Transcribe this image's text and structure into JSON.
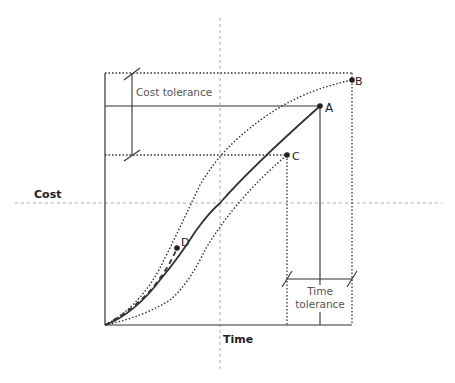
{
  "diagram": {
    "type": "project cost/time tolerance diagram",
    "axis_labels": {
      "cost": "Cost",
      "time": "Time"
    },
    "tolerance_labels": {
      "cost": "Cost tolerance",
      "time_line1": "Time",
      "time_line2": "tolerance"
    },
    "points": [
      {
        "id": "A",
        "label": "A",
        "meaning": "planned end point"
      },
      {
        "id": "B",
        "label": "B",
        "meaning": "max cost / max time tolerance"
      },
      {
        "id": "C",
        "label": "C",
        "meaning": "min cost / min time tolerance"
      },
      {
        "id": "D",
        "label": "D",
        "meaning": "current actual progress"
      }
    ],
    "curves": [
      {
        "name": "planned",
        "style": "solid",
        "from": "origin",
        "to": "A"
      },
      {
        "name": "upper-tolerance",
        "style": "dotted",
        "from": "origin",
        "to": "B"
      },
      {
        "name": "lower-tolerance",
        "style": "dotted",
        "from": "origin",
        "to": "C"
      },
      {
        "name": "actual",
        "style": "dashed",
        "from": "origin",
        "to": "D"
      }
    ],
    "colors": {
      "line": "#333333",
      "guide": "#999999"
    }
  }
}
